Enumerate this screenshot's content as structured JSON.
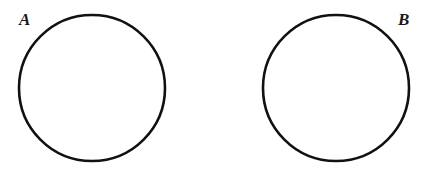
{
  "figure": {
    "canvas": {
      "width": 424,
      "height": 174,
      "background_color": "#ffffff"
    },
    "style": {
      "stroke_color": "#111111",
      "stroke_width": 2.6,
      "fill": "none",
      "label_color": "#1a1a1a"
    },
    "shapes": [
      {
        "id": "circle-a",
        "kind": "circle",
        "label": "A",
        "cx": 92,
        "cy": 88,
        "r": 73,
        "label_position": "upper-left-outside"
      },
      {
        "id": "circle-b",
        "kind": "circle",
        "label": "B",
        "cx": 336,
        "cy": 88,
        "r": 73,
        "label_position": "upper-right-outside"
      }
    ]
  }
}
